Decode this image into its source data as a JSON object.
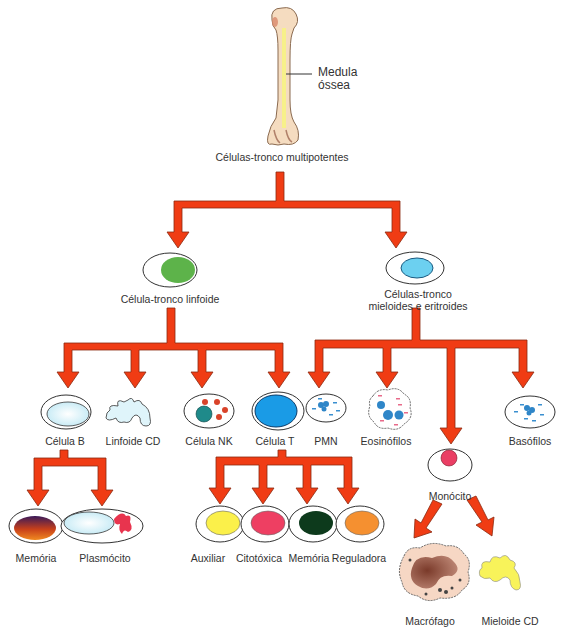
{
  "title_node": {
    "label": "Células-tronco multipotentes"
  },
  "bone": {
    "annotation_line1": "Medula",
    "annotation_line2": "óssea"
  },
  "colors": {
    "arrow_fill": "#f03c14",
    "arrow_stroke": "#8a2a10",
    "bone": "#f5dcc0",
    "marrow": "#f7f08a"
  },
  "level1": [
    {
      "label": "Célula-tronco linfoide",
      "nucleus_color": "#5db34a"
    },
    {
      "label_line1": "Células-tronco",
      "label_line2": "mieloides e eritroides",
      "nucleus_color": "#6cd0f0"
    }
  ],
  "lymphoid_children": [
    {
      "label": "Célula B",
      "color": "#dff4fa"
    },
    {
      "label": "Linfoide CD",
      "color": "#dff4fa"
    },
    {
      "label": "Célula NK",
      "color": "#1f8a8a"
    },
    {
      "label": "Célula T",
      "color": "#1a9be6"
    }
  ],
  "myeloid_children": [
    {
      "label": "PMN",
      "color": "#3a8fd0"
    },
    {
      "label": "Eosinófilos",
      "color": "#2f86c8"
    },
    {
      "label": "Monócito",
      "color": "#ea3e64"
    },
    {
      "label": "Basófilos",
      "color": "#3a8fd0"
    }
  ],
  "b_cell_children": [
    {
      "label": "Memória",
      "color": "#c2401a"
    },
    {
      "label": "Plasmócito",
      "color": "#e8344e"
    }
  ],
  "t_cell_children": [
    {
      "label": "Auxiliar",
      "color": "#fbf04a"
    },
    {
      "label": "Citotóxica",
      "color": "#ee3f62"
    },
    {
      "label": "Memória",
      "color": "#0d3a1c"
    },
    {
      "label": "Reguladora",
      "color": "#f59030"
    }
  ],
  "monocyte_children": [
    {
      "label": "Macrófago",
      "color": "#a0604a"
    },
    {
      "label": "Mieloide CD",
      "color": "#f8f35a"
    }
  ]
}
